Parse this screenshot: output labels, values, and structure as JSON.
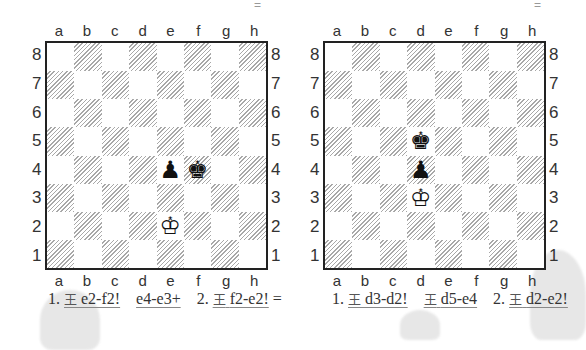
{
  "files": [
    "a",
    "b",
    "c",
    "d",
    "e",
    "f",
    "g",
    "h"
  ],
  "ranks": [
    "8",
    "7",
    "6",
    "5",
    "4",
    "3",
    "2",
    "1"
  ],
  "piece_glyphs": {
    "white-king": "♔",
    "black-king": "♚",
    "black-pawn": "♟"
  },
  "king_symbol": "王",
  "diagrams": [
    {
      "evaluation": "=",
      "pieces": [
        {
          "type": "black-pawn",
          "square": "e4"
        },
        {
          "type": "black-king",
          "square": "f4"
        },
        {
          "type": "white-king",
          "square": "e2"
        }
      ],
      "moves": {
        "m1_num": "1.",
        "m1_white": "e2-f2!",
        "m1_black": "e4-e3+",
        "m2_num": "2.",
        "m2_white": "f2-e2!",
        "result": "="
      }
    },
    {
      "evaluation": "=",
      "pieces": [
        {
          "type": "black-king",
          "square": "d5"
        },
        {
          "type": "black-pawn",
          "square": "d4"
        },
        {
          "type": "white-king",
          "square": "d3"
        }
      ],
      "moves": {
        "m1_num": "1.",
        "m1_white": "d3-d2!",
        "m1_black": "d5-e4",
        "m2_num": "2.",
        "m2_white": "d2-e2!",
        "result": ""
      }
    }
  ]
}
